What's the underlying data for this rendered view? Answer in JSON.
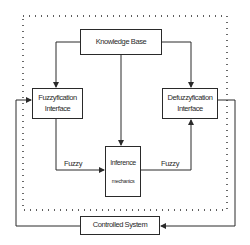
{
  "diagram": {
    "type": "fuzzy-logic-controller-block-diagram",
    "nodes": {
      "knowledge_base": {
        "label": "Knowledge Base"
      },
      "fuzzyfication": {
        "line1": "Fuzzyfication",
        "line2": "Interface"
      },
      "defuzzyfication": {
        "line1": "Defuzzyfication",
        "line2": "Interface"
      },
      "inference": {
        "line1": "Inference",
        "line2": "mechanics"
      },
      "controlled_system": {
        "label": "Controlled System"
      }
    },
    "edge_labels": {
      "fuzzy_left": "Fuzzy",
      "fuzzy_right": "Fuzzy"
    },
    "edges": [
      {
        "from": "knowledge_base",
        "to": "fuzzyfication"
      },
      {
        "from": "knowledge_base",
        "to": "defuzzyfication"
      },
      {
        "from": "knowledge_base",
        "to": "inference"
      },
      {
        "from": "fuzzyfication",
        "to": "inference",
        "label": "Fuzzy"
      },
      {
        "from": "inference",
        "to": "defuzzyfication",
        "label": "Fuzzy"
      },
      {
        "from": "defuzzyfication",
        "to": "controlled_system"
      },
      {
        "from": "controlled_system",
        "to": "fuzzyfication"
      }
    ],
    "boundary": "dotted",
    "colors": {
      "line": "#2a2a2a",
      "background": "#ffffff"
    }
  }
}
